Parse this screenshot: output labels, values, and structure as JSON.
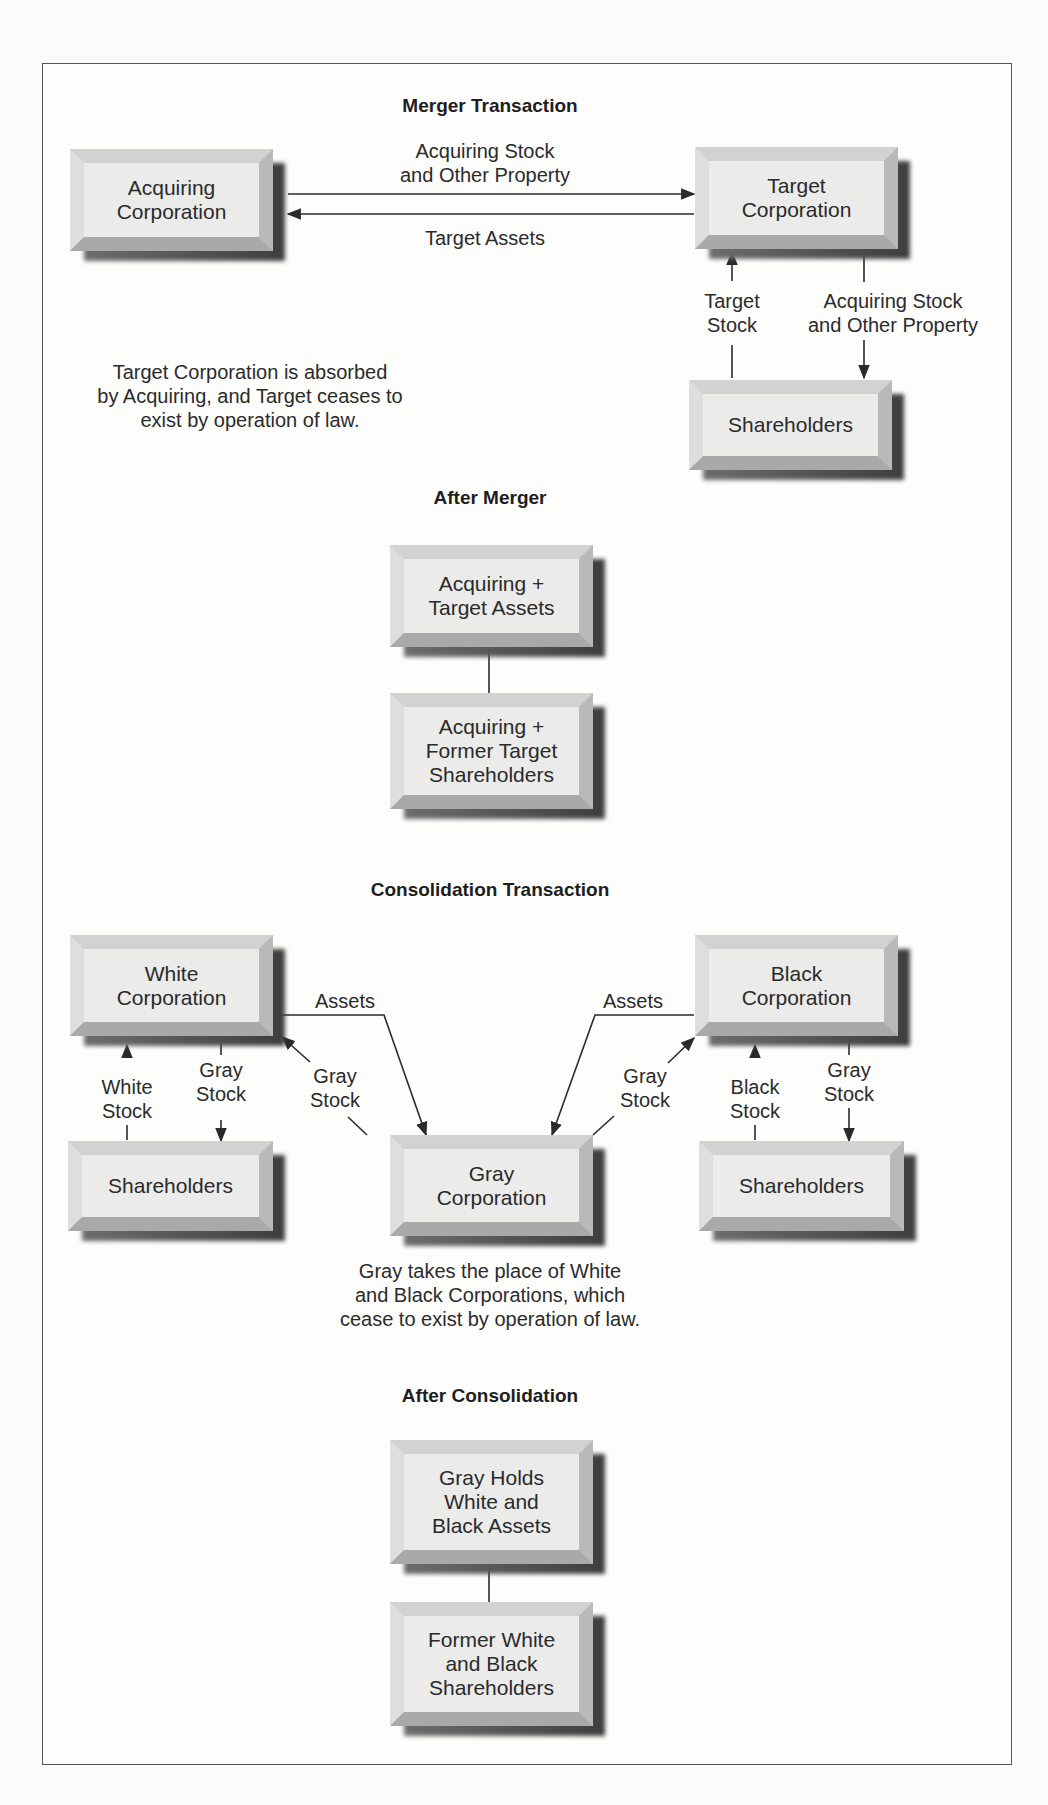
{
  "merger": {
    "heading": "Merger Transaction",
    "boxes": {
      "acquiring": "Acquiring\nCorporation",
      "target": "Target\nCorporation",
      "shareholders": "Shareholders"
    },
    "flows": {
      "acquiring_to_target": "Acquiring Stock\nand Other Property",
      "target_to_acquiring": "Target Assets",
      "shareholders_to_target": "Target\nStock",
      "target_to_shareholders": "Acquiring Stock\nand Other Property"
    },
    "note": "Target Corporation is absorbed\nby Acquiring, and Target ceases to\nexist by operation of law."
  },
  "after_merger": {
    "heading": "After Merger",
    "boxes": {
      "assets": "Acquiring +\nTarget Assets",
      "shareholders": "Acquiring +\nFormer Target\nShareholders"
    }
  },
  "consolidation": {
    "heading": "Consolidation Transaction",
    "boxes": {
      "white": "White\nCorporation",
      "black": "Black\nCorporation",
      "gray": "Gray\nCorporation",
      "white_shareholders": "Shareholders",
      "black_shareholders": "Shareholders"
    },
    "flows": {
      "white_assets": "Assets",
      "black_assets": "Assets",
      "gray_stock_to_white": "Gray\nStock",
      "gray_stock_to_black": "Gray\nStock",
      "white_stock": "White\nStock",
      "white_gray_stock": "Gray\nStock",
      "black_stock": "Black\nStock",
      "black_gray_stock": "Gray\nStock"
    },
    "note": "Gray takes the place of White\nand Black Corporations, which\ncease to exist by operation of law."
  },
  "after_consolidation": {
    "heading": "After Consolidation",
    "boxes": {
      "assets": "Gray Holds\nWhite and\nBlack Assets",
      "shareholders": "Former White\nand Black\nShareholders"
    }
  },
  "colors": {
    "frame": "#555555",
    "box_face": "#ebebea",
    "line": "#2a2a2a"
  }
}
